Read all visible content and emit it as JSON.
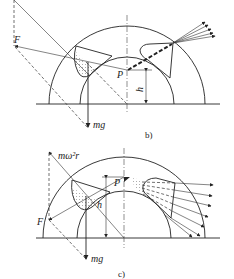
{
  "figures": [
    {
      "id": "b",
      "caption": "b)",
      "labels": {
        "force": "F",
        "gravity": "mg",
        "point": "P",
        "height": "h"
      },
      "description": "Semicircular drum cross-section with bucket at left, pivot P, height h, discharge jet to upper-right"
    },
    {
      "id": "c",
      "caption": "c)",
      "labels": {
        "force": "F",
        "gravity": "mg",
        "point": "P",
        "height": "h",
        "centrifugal": "mω²r"
      },
      "description": "Semicircular drum cross-section with bucket at left, centrifugal force mω²r, pivot P, discharge spray to right"
    }
  ],
  "colors": {
    "line": "#222222",
    "background": "#ffffff",
    "stipple": "#555555"
  }
}
